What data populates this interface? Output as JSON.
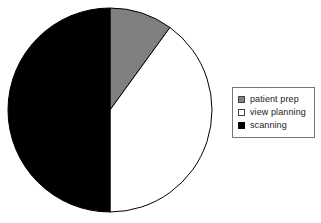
{
  "chart_data": {
    "type": "pie",
    "title": "",
    "subtitle": "",
    "xlabel": "",
    "ylabel": "",
    "categories": [
      "patient prep",
      "view planning",
      "scanning"
    ],
    "values": [
      10,
      40,
      50
    ],
    "unit": "%",
    "slices": [
      {
        "label": "patient prep",
        "value": 10,
        "color": "#808080",
        "start_angle_deg": 0,
        "end_angle_deg": 36,
        "sweep_deg": 36
      },
      {
        "label": "view planning",
        "value": 40,
        "color": "#ffffff",
        "start_angle_deg": 36,
        "end_angle_deg": 180,
        "sweep_deg": 144
      },
      {
        "label": "scanning",
        "value": 50,
        "color": "#000000",
        "start_angle_deg": 180,
        "end_angle_deg": 360,
        "sweep_deg": 180
      }
    ],
    "start_angle_deg": 0,
    "direction": "clockwise",
    "grid": false,
    "legend": {
      "position": "right",
      "border_color": "#777777",
      "entries": [
        {
          "label": "patient prep",
          "swatch": "gray"
        },
        {
          "label": "view planning",
          "swatch": "white"
        },
        {
          "label": "scanning",
          "swatch": "black"
        }
      ]
    },
    "stroke_color": "#000000",
    "background": "#ffffff"
  },
  "figure": {
    "pie_name": "pie-chart",
    "center_x": 110,
    "center_y": 110,
    "radius": 102
  }
}
